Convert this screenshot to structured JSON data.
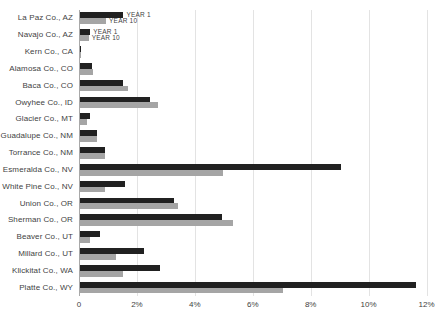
{
  "colors": {
    "background": "#ffffff",
    "gridline": "#e3e3e3",
    "y_axis_line": "#a8a8a8",
    "text": "#3f3f3f",
    "series_year1": "#212121",
    "series_year10": "#a5a5a5"
  },
  "chart_data": {
    "type": "bar",
    "orientation": "horizontal",
    "title": "",
    "xlabel": "",
    "ylabel": "",
    "values_unit": "percent",
    "xlim": [
      0,
      12
    ],
    "grid": true,
    "legend_position": "inline labels next to bars of first two categories",
    "x_ticks": [
      {
        "value": 0,
        "label": "0"
      },
      {
        "value": 2,
        "label": "2%"
      },
      {
        "value": 4,
        "label": "4%"
      },
      {
        "value": 6,
        "label": "6%"
      },
      {
        "value": 8,
        "label": "8%"
      },
      {
        "value": 10,
        "label": "10%"
      },
      {
        "value": 12,
        "label": "12%"
      }
    ],
    "categories": [
      "La Paz Co., AZ",
      "Navajo Co., AZ",
      "Kern Co., CA",
      "Alamosa Co., CO",
      "Baca Co., CO",
      "Owyhee Co., ID",
      "Glacier Co., MT",
      "Guadalupe Co., NM",
      "Torrance Co., NM",
      "Esmeralda Co., NV",
      "White Pine Co., NV",
      "Union Co., OR",
      "Sherman Co., OR",
      "Beaver Co., UT",
      "Millard Co., UT",
      "Klickitat Co., WA",
      "Platte Co., WY"
    ],
    "series": [
      {
        "name": "YEAR 1",
        "color": "#212121",
        "values": [
          1.5,
          0.35,
          0.05,
          0.4,
          1.5,
          2.4,
          0.35,
          0.6,
          0.85,
          9.0,
          1.55,
          3.25,
          4.9,
          0.7,
          2.2,
          2.75,
          11.6
        ]
      },
      {
        "name": "YEAR 10",
        "color": "#a5a5a5",
        "values": [
          0.9,
          0.3,
          0.03,
          0.45,
          1.65,
          2.7,
          0.25,
          0.6,
          0.85,
          4.95,
          0.85,
          3.4,
          5.3,
          0.35,
          1.25,
          1.5,
          7.0
        ]
      }
    ],
    "inline_label_rows": [
      0,
      1
    ]
  }
}
